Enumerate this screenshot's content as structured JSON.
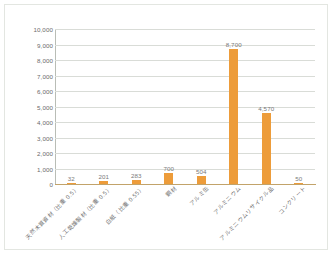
{
  "chart_data": {
    "type": "bar",
    "title": "",
    "subtitle": "",
    "xlabel": "",
    "ylabel": "",
    "ylim": [
      0,
      10000
    ],
    "ytick_step": 1000,
    "grid": "horizontal",
    "legend": "none",
    "orientation": "vertical",
    "bar_color": "#ED9C3A",
    "gridline_color": "#D9DCD7",
    "label_color": "#707070",
    "categories": [
      "天然木質資材（比重 0.5）",
      "人工乾燥製材（比重 0.5）",
      "白紙（比重 0.55）",
      "鋼材",
      "アルミ缶",
      "アルミニウム",
      "アルミニウムリサイクル品",
      "コンクリート"
    ],
    "values": [
      32,
      201,
      283,
      700,
      504,
      8700,
      4570,
      50
    ],
    "value_labels": [
      "32",
      "201",
      "283",
      "700",
      "504",
      "8,700",
      "4,570",
      "50"
    ],
    "ytick_labels": [
      "10,000",
      "9,000",
      "8,000",
      "7,000",
      "6,000",
      "5,000",
      "4,000",
      "3,000",
      "2,000",
      "1,000",
      "0"
    ],
    "ytick_values": [
      10000,
      9000,
      8000,
      7000,
      6000,
      5000,
      4000,
      3000,
      2000,
      1000,
      0
    ]
  }
}
